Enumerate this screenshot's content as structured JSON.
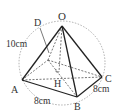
{
  "diagram": {
    "title": "",
    "type": "square pyramid inscribed in sphere",
    "vertices": {
      "apex": "O",
      "base": [
        "A",
        "B",
        "C"
      ],
      "foot_of_perpendicular": "H",
      "point_on_edge": "D"
    },
    "labels": {
      "O": "O",
      "D": "D",
      "A": "A",
      "B": "B",
      "C": "C",
      "H": "H",
      "edge_OA": "10cm",
      "edge_AB": "8cm",
      "edge_BC": "8cm"
    },
    "colors": {
      "line": "#222222",
      "dashed": "#555555",
      "circle": "#888888",
      "text": "#333333"
    }
  }
}
